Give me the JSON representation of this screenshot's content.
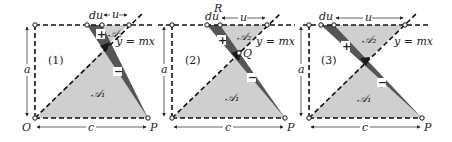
{
  "figure": {
    "type": "three-panel geometry diagram",
    "colors": {
      "light_fill": "#cfcfcf",
      "dark_strip": "#555555",
      "darkest_overlap": "#1a1a1a",
      "line": "#111111",
      "sign_box": "#ffffff"
    },
    "panels": [
      {
        "id": "1",
        "label": "(1)",
        "area1": "𝒜₁",
        "area2": "𝒜₂",
        "plus": "+",
        "minus": "−",
        "line_label": "y = mx",
        "du": "du",
        "u": "u",
        "a": "a",
        "c": "c",
        "O": "O",
        "P": "P"
      },
      {
        "id": "2",
        "label": "(2)",
        "area1": "𝒜₁",
        "area2": "𝒜₂",
        "plus": "+",
        "minus": "−",
        "line_label": "y = mx",
        "du": "du",
        "u": "u",
        "a": "a",
        "c": "c",
        "P": "P",
        "R": "R",
        "Q": "Q"
      },
      {
        "id": "3",
        "label": "(3)",
        "area1": "𝒜₁",
        "area2": "𝒜₂",
        "plus": "+",
        "minus": "−",
        "line_label": "y = mx",
        "du": "du",
        "u": "u",
        "a": "a",
        "c": "c",
        "P": "P"
      }
    ]
  }
}
